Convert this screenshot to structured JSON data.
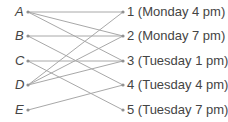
{
  "left_nodes": [
    {
      "id": "A",
      "label": "A",
      "y": 12
    },
    {
      "id": "B",
      "label": "B",
      "y": 36
    },
    {
      "id": "C",
      "label": "C",
      "y": 61
    },
    {
      "id": "D",
      "label": "D",
      "y": 85
    },
    {
      "id": "E",
      "label": "E",
      "y": 110
    }
  ],
  "right_nodes": [
    {
      "id": "1",
      "label": "1 (Monday 4 pm)",
      "y": 12
    },
    {
      "id": "2",
      "label": "2 (Monday 7 pm)",
      "y": 36
    },
    {
      "id": "3",
      "label": "3 (Tuesday 1 pm)",
      "y": 61
    },
    {
      "id": "4",
      "label": "4 (Tuesday 4 pm)",
      "y": 85
    },
    {
      "id": "5",
      "label": "5 (Tuesday 7 pm)",
      "y": 110
    }
  ],
  "edges": [
    [
      "A",
      "1"
    ],
    [
      "A",
      "2"
    ],
    [
      "A",
      "3"
    ],
    [
      "B",
      "2"
    ],
    [
      "B",
      "4"
    ],
    [
      "C",
      "3"
    ],
    [
      "C",
      "5"
    ],
    [
      "D",
      "1"
    ],
    [
      "D",
      "2"
    ],
    [
      "D",
      "3"
    ],
    [
      "E",
      "4"
    ]
  ],
  "colors": {
    "line": "#a8a8a8",
    "dot": "#909090",
    "text": "#444444"
  }
}
